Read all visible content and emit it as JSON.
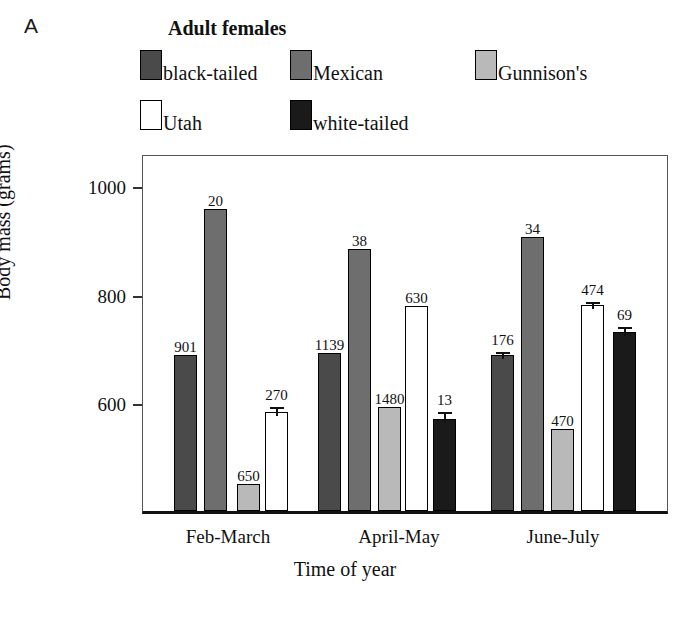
{
  "panel": {
    "letter": "A"
  },
  "legend": {
    "title": "Adult females",
    "entries": [
      {
        "label": "black-tailed",
        "color": "#4a4a4a"
      },
      {
        "label": "Mexican",
        "color": "#6e6e6e"
      },
      {
        "label": "Gunnison's",
        "color": "#b9b9b9"
      },
      {
        "label": "Utah",
        "color": "#ffffff"
      },
      {
        "label": "white-tailed",
        "color": "#1a1a1a"
      }
    ]
  },
  "axes": {
    "ylabel": "Body mass (grams)",
    "xlabel": "Time of year",
    "yticks": [
      600,
      800,
      1000
    ],
    "ytick_labels": [
      "600",
      "800",
      "1000"
    ]
  },
  "chart_data": {
    "type": "bar",
    "title": "Adult females",
    "xlabel": "Time of year",
    "ylabel": "Body mass (grams)",
    "categories": [
      "Feb-March",
      "April-May",
      "June-July"
    ],
    "ylim": [
      450,
      1025
    ],
    "yticks": [
      600,
      800,
      1000
    ],
    "grid": false,
    "legend_position": "above-plot",
    "note": "Numbers printed above each bar are sample sizes (n), not bar values.",
    "series": [
      {
        "name": "black-tailed",
        "color": "#4a4a4a",
        "values": [
          687,
          690,
          687
        ],
        "sample_labels": [
          "901",
          "1139",
          "176"
        ],
        "errors": [
          null,
          null,
          12
        ]
      },
      {
        "name": "Mexican",
        "color": "#6e6e6e",
        "values": [
          956,
          882,
          904
        ],
        "sample_labels": [
          "20",
          "38",
          "34"
        ],
        "errors": [
          null,
          null,
          null
        ]
      },
      {
        "name": "Gunnison's",
        "color": "#b9b9b9",
        "values": [
          449,
          591,
          550
        ],
        "sample_labels": [
          "650",
          "1480",
          "470"
        ],
        "errors": [
          null,
          null,
          null
        ]
      },
      {
        "name": "Utah",
        "color": "#ffffff",
        "values": [
          582,
          777,
          779
        ],
        "sample_labels": [
          "270",
          "630",
          "474"
        ],
        "errors": [
          16,
          null,
          12
        ]
      },
      {
        "name": "white-tailed",
        "color": "#1a1a1a",
        "values": [
          null,
          569,
          729
        ],
        "sample_labels": [
          null,
          "13",
          "69"
        ],
        "errors": [
          null,
          20,
          16
        ]
      }
    ]
  },
  "layout": {
    "plot": {
      "left": 142,
      "top": 155,
      "width": 526,
      "height": 359
    },
    "y_scale": {
      "y_at_1000": 33,
      "px_per_unit": 0.5425
    },
    "bar_width": 23,
    "groups": [
      {
        "label": "Feb-March",
        "center_x": 228,
        "bar_x": [
          173,
          203,
          236,
          264,
          null
        ]
      },
      {
        "label": "April-May",
        "center_x": 399,
        "bar_x": [
          317,
          347,
          377,
          404,
          432
        ]
      },
      {
        "label": "June-July",
        "center_x": 563,
        "bar_x": [
          490,
          520,
          550,
          580,
          612
        ]
      }
    ]
  }
}
